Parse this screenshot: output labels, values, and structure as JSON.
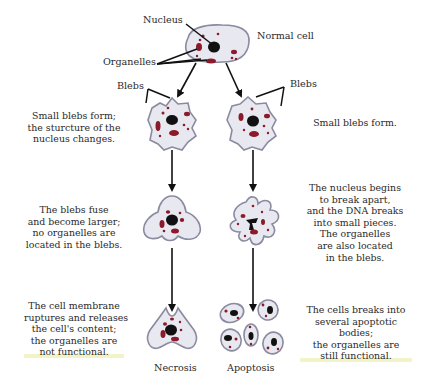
{
  "diagram": {
    "type": "process-flow",
    "colors": {
      "cell_fill": "#e8e8f0",
      "cell_outline": "#8a8aa0",
      "nucleus": "#111111",
      "organelle": "#8b1a2a",
      "arrow": "#111111",
      "text": "#2a2a2a"
    },
    "labels": {
      "nucleus": "Nucleus",
      "organelles": "Organelles",
      "normal_cell": "Normal cell",
      "blebs_left": "Blebs",
      "blebs_right": "Blebs",
      "necrosis": "Necrosis",
      "apoptosis": "Apoptosis"
    },
    "necrosis_steps": [
      {
        "lines": [
          "Small blebs form;",
          "the sturcture of the",
          "nucleus changes."
        ]
      },
      {
        "lines": [
          "The blebs fuse",
          "and become larger;",
          "no organelles are",
          "located in the blebs."
        ]
      },
      {
        "lines": [
          "The cell membrane",
          "ruptures and releases",
          "the cell's content;",
          "the organelles are",
          "not functional."
        ]
      }
    ],
    "apoptosis_steps": [
      {
        "lines": [
          "Small blebs form."
        ]
      },
      {
        "lines": [
          "The nucleus begins",
          "to break apart,",
          "and the DNA breaks",
          "into small pieces.",
          "The organelles",
          "are also located",
          "in the blebs."
        ]
      },
      {
        "lines": [
          "The cells breaks into",
          "several apoptotic",
          "bodies;",
          "the organelles are",
          "still functional."
        ]
      }
    ]
  }
}
